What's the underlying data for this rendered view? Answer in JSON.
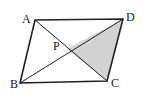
{
  "diagram": {
    "type": "parallelogram-with-diagonals",
    "points": {
      "A": {
        "label": "A",
        "x": 35,
        "y": 20
      },
      "D": {
        "label": "D",
        "x": 123,
        "y": 19
      },
      "B": {
        "label": "B",
        "x": 20,
        "y": 83
      },
      "C": {
        "label": "C",
        "x": 107,
        "y": 81
      },
      "P": {
        "label": "P",
        "x": 67,
        "y": 49
      }
    },
    "shaded_region": [
      "P",
      "D",
      "C"
    ],
    "colors": {
      "stroke": "#222222",
      "shade": "#d3d3d3"
    }
  }
}
